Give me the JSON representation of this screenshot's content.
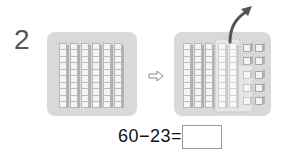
{
  "problem": {
    "number": "2",
    "equation": "60−23=",
    "answer_value": ""
  },
  "left_panel": {
    "description": "6 rods of ten",
    "rods": 6,
    "segments_per_rod": 10
  },
  "right_panel": {
    "description": "5 rods of ten plus 10 unit cubes; 2 rods and 3 cubes circled and taken away",
    "rods": 5,
    "unit_cubes": 10,
    "circled_rods": 2,
    "circled_cubes": 3
  },
  "icons": {
    "transition_arrow": "hollow-right-arrow",
    "take_away_arrow": "curved-up-arrow"
  },
  "colors": {
    "panel_bg": "#d9d9d9",
    "block_fill": "#f2f2f2",
    "block_edge": "#b8b8b8",
    "text": "#111111",
    "number_label": "#555555"
  }
}
